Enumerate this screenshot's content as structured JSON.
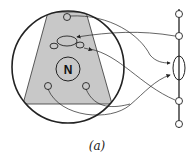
{
  "diagram": {
    "center_label": "N",
    "caption": "(a)",
    "colors": {
      "stroke": "#222222",
      "fill": "#c8c8c8",
      "background": "#ffffff"
    }
  }
}
